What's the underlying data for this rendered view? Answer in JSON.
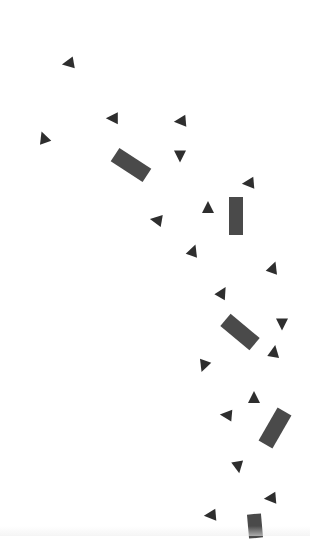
{
  "scene": {
    "background": "#ffffff",
    "triangle_color": "#2e2e2e",
    "rect_color": "#4a4a4a",
    "particles": [
      {
        "type": "tri",
        "x": 69,
        "y": 62,
        "size": 12,
        "rot": -100
      },
      {
        "type": "tri",
        "x": 113,
        "y": 117,
        "size": 12,
        "rot": -90
      },
      {
        "type": "tri",
        "x": 181,
        "y": 120,
        "size": 12,
        "rot": -95
      },
      {
        "type": "tri",
        "x": 44,
        "y": 137,
        "size": 12,
        "rot": -20
      },
      {
        "type": "tri",
        "x": 180,
        "y": 154,
        "size": 12,
        "rot": 180
      },
      {
        "type": "rect",
        "x": 131,
        "y": 165,
        "w": 38,
        "h": 16,
        "rot": 33
      },
      {
        "type": "tri",
        "x": 249,
        "y": 182,
        "size": 12,
        "rot": -95
      },
      {
        "type": "tri",
        "x": 208,
        "y": 207,
        "size": 12,
        "rot": 0
      },
      {
        "type": "rect",
        "x": 236,
        "y": 216,
        "w": 14,
        "h": 38,
        "rot": 0
      },
      {
        "type": "tri",
        "x": 157,
        "y": 219,
        "size": 12,
        "rot": -80
      },
      {
        "type": "tri",
        "x": 193,
        "y": 250,
        "size": 12,
        "rot": 20
      },
      {
        "type": "tri",
        "x": 273,
        "y": 267,
        "size": 12,
        "rot": 20
      },
      {
        "type": "tri",
        "x": 222,
        "y": 292,
        "size": 12,
        "rot": 30
      },
      {
        "type": "tri",
        "x": 282,
        "y": 322,
        "size": 12,
        "rot": 180
      },
      {
        "type": "rect",
        "x": 240,
        "y": 332,
        "w": 38,
        "h": 16,
        "rot": 40
      },
      {
        "type": "tri",
        "x": 274,
        "y": 351,
        "size": 12,
        "rot": 10
      },
      {
        "type": "tri",
        "x": 204,
        "y": 364,
        "size": 12,
        "rot": 200
      },
      {
        "type": "tri",
        "x": 254,
        "y": 397,
        "size": 12,
        "rot": 0
      },
      {
        "type": "tri",
        "x": 227,
        "y": 414,
        "size": 12,
        "rot": -85
      },
      {
        "type": "rect",
        "x": 275,
        "y": 428,
        "w": 16,
        "h": 38,
        "rot": 30
      },
      {
        "type": "tri",
        "x": 238,
        "y": 465,
        "size": 12,
        "rot": 170
      },
      {
        "type": "tri",
        "x": 271,
        "y": 497,
        "size": 12,
        "rot": -95
      },
      {
        "type": "tri",
        "x": 211,
        "y": 514,
        "size": 12,
        "rot": -95
      },
      {
        "type": "rect",
        "x": 255,
        "y": 526,
        "w": 14,
        "h": 24,
        "rot": -5
      }
    ]
  }
}
